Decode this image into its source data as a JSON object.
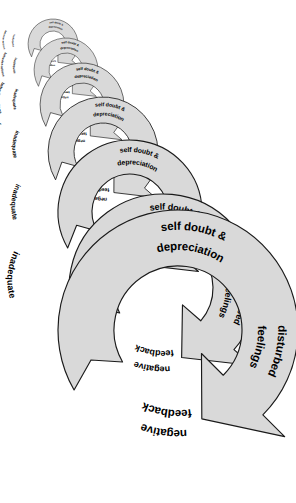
{
  "figure": {
    "name": "vicious-cycle-spiral",
    "type": "cycle-spiral-diagram",
    "background_color": "#ffffff",
    "band_fill_color": "#d9d9d9",
    "band_stroke_color": "#1a1a1a",
    "text_color": "#000000",
    "cycle_count": 7,
    "growth_direction": "top-left to bottom-right"
  },
  "stages": {
    "self_doubt": "self doubt &",
    "self_doubt_line2": "depreciation",
    "disturbed": "disturbed",
    "disturbed_line2": "feelings",
    "negative": "negative",
    "negative_line2": "feedback",
    "inadequate": "inadequate",
    "inadequate_line2": "behavior-actions"
  },
  "chart_data": {
    "type": "diagram",
    "title": "",
    "stage_sequence": [
      "self doubt & depreciation",
      "disturbed feelings",
      "negative feedback",
      "inadequate behavior-actions"
    ],
    "cycles": [
      {
        "index": 1,
        "size": "smallest",
        "center_x": 53,
        "center_y": 44,
        "outer_radius": 25,
        "inner_radius": 13,
        "labels": [
          "self doubt & depreciation",
          "disturbed feelings",
          "negative feedback",
          "inadequate behavior-actions"
        ]
      },
      {
        "index": 2,
        "size": "very-small",
        "center_x": 66,
        "center_y": 70,
        "outer_radius": 32,
        "inner_radius": 17,
        "labels": [
          "self doubt & depreciation",
          "disturbed feelings",
          "negative feedback",
          "inadequate behavior-actions"
        ]
      },
      {
        "index": 3,
        "size": "small",
        "center_x": 82,
        "center_y": 105,
        "outer_radius": 42,
        "inner_radius": 22,
        "labels": [
          "self doubt & depreciation",
          "disturbed feelings",
          "negative feedback",
          "inadequate behavior-actions"
        ]
      },
      {
        "index": 4,
        "size": "medium-small",
        "center_x": 103,
        "center_y": 152,
        "outer_radius": 55,
        "inner_radius": 29,
        "labels": [
          "self doubt & depreciation",
          "disturbed feelings",
          "negative feedback",
          "inadequate behavior-actions"
        ]
      },
      {
        "index": 5,
        "size": "medium",
        "center_x": 130,
        "center_y": 212,
        "outer_radius": 72,
        "inner_radius": 38,
        "labels": [
          "self doubt & depreciation",
          "disturbed feelings",
          "negative feedback",
          "inadequate behavior-actions"
        ]
      },
      {
        "index": 6,
        "size": "large",
        "center_x": 163,
        "center_y": 288,
        "outer_radius": 94,
        "inner_radius": 50,
        "labels": [
          "self doubt & depreciation",
          "disturbed feelings",
          "negative feedback",
          "inadequate behavior-actions"
        ]
      },
      {
        "index": 7,
        "size": "largest",
        "center_x": 178,
        "center_y": 330,
        "outer_radius": 120,
        "inner_radius": 64,
        "labels": [
          "self doubt & depreciation",
          "disturbed feelings",
          "negative feedback",
          "inadequate behavior-actions"
        ]
      }
    ]
  }
}
